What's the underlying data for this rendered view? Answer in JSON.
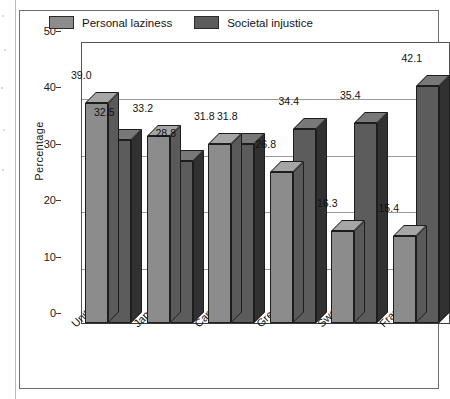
{
  "chart_data": {
    "type": "bar",
    "title": "",
    "subtitle": "",
    "xlabel": "",
    "ylabel": "Percentage",
    "ylim": [
      0,
      50
    ],
    "yticks": [
      0,
      10,
      20,
      30,
      40,
      50
    ],
    "ytick_labels": [
      "0",
      "10",
      "20",
      "30",
      "40",
      "50"
    ],
    "grid": "horizontal",
    "legend_position": "top-inside",
    "style": "3d-bars",
    "categories": [
      "United States",
      "Japan",
      "Canada",
      "Great Britain",
      "Sweden",
      "France"
    ],
    "series": [
      {
        "name": "Personal laziness",
        "color": "#8c8c8c",
        "top_color": "#a6a6a6",
        "side_color": "#5a5a5a",
        "values": [
          39.0,
          33.2,
          31.8,
          26.8,
          16.3,
          15.4
        ],
        "labels": [
          "39.0",
          "33.2",
          "31.8",
          "26.8",
          "16.3",
          "15.4"
        ]
      },
      {
        "name": "Societal injustice",
        "color": "#5c5c5c",
        "top_color": "#787878",
        "side_color": "#313131",
        "values": [
          32.5,
          28.8,
          31.8,
          34.4,
          35.4,
          42.1
        ],
        "labels": [
          "32.5",
          "28.8",
          "31.8",
          "34.4",
          "35.4",
          "42.1"
        ]
      }
    ]
  },
  "colors": {
    "series_1": "#8c8c8c",
    "series_2": "#5c5c5c",
    "axis": "#3a3a3a",
    "gridline": "#9a9a9a",
    "frame": "#6f6f6f",
    "text": "#111111",
    "background": "#ffffff"
  }
}
